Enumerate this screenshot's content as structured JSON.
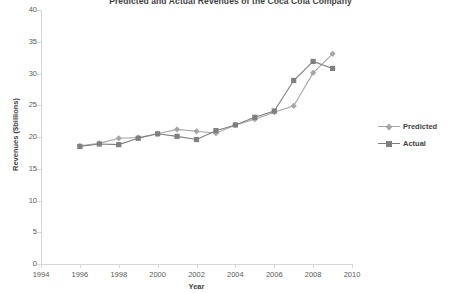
{
  "chart_data": {
    "type": "line",
    "title": "Predicted and Actual Revenues of the Coca Cola Company",
    "xlabel": "Year",
    "ylabel": "Revenues ($billions)",
    "xlim": [
      1994,
      2010
    ],
    "ylim": [
      0,
      40
    ],
    "xticks": [
      1994,
      1996,
      1998,
      2000,
      2002,
      2004,
      2006,
      2008,
      2010
    ],
    "yticks": [
      0,
      5,
      10,
      15,
      20,
      25,
      30,
      35,
      40
    ],
    "grid": false,
    "legend_position": "right",
    "x": [
      1996,
      1997,
      1998,
      1999,
      2000,
      2001,
      2002,
      2003,
      2004,
      2005,
      2006,
      2007,
      2008,
      2009
    ],
    "series": [
      {
        "name": "Predicted",
        "color": "#a6a6a6",
        "marker": "diamond",
        "values": [
          18.6,
          19.0,
          19.8,
          19.9,
          20.5,
          21.2,
          20.9,
          20.6,
          21.9,
          22.8,
          23.9,
          24.9,
          30.1,
          33.1
        ]
      },
      {
        "name": "Actual",
        "color": "#7f7f7f",
        "marker": "square",
        "values": [
          18.5,
          18.9,
          18.8,
          19.8,
          20.5,
          20.1,
          19.6,
          21.0,
          21.9,
          23.1,
          24.1,
          28.9,
          31.9,
          30.8
        ]
      }
    ]
  },
  "legend": {
    "items": [
      {
        "label": "Predicted"
      },
      {
        "label": "Actual"
      }
    ]
  }
}
